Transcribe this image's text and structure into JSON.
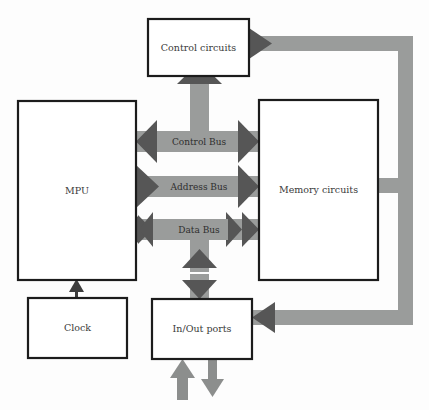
{
  "diagram": {
    "colors": {
      "background": "#fdfdfd",
      "box_fill": "#ffffff",
      "box_border": "#1c1c1c",
      "bus_gray": "#9a9c9b",
      "arrow_dark": "#565656",
      "thin_arrow": "#3d3d3d",
      "text": "#3a3a3a"
    },
    "blocks": [
      {
        "id": "control-circuits",
        "label": "Control circuits",
        "x": 148,
        "y": 19,
        "w": 101,
        "h": 57
      },
      {
        "id": "mpu",
        "label": "MPU",
        "x": 18,
        "y": 101,
        "w": 118,
        "h": 179
      },
      {
        "id": "memory-circuits",
        "label": "Memory circuits",
        "x": 259,
        "y": 100,
        "w": 119,
        "h": 180
      },
      {
        "id": "clock",
        "label": "Clock",
        "x": 28,
        "y": 298,
        "w": 99,
        "h": 60
      },
      {
        "id": "inout-ports",
        "label": "In/Out ports",
        "x": 152,
        "y": 299,
        "w": 100,
        "h": 60
      }
    ],
    "buses": [
      {
        "id": "control-bus",
        "label": "Control Bus",
        "y": 141,
        "direction": "bidirectional-outward"
      },
      {
        "id": "address-bus",
        "label": "Address Bus",
        "y": 186,
        "direction": "mpu-to-memory"
      },
      {
        "id": "data-bus",
        "label": "Data Bus",
        "y": 229,
        "direction": "bidirectional"
      }
    ],
    "connections": [
      {
        "id": "control-bus-to-control-circuits",
        "type": "vertical-gray-arrow-up"
      },
      {
        "id": "data-bus-to-inout-ports",
        "type": "vertical-gray-double-arrow"
      },
      {
        "id": "clock-to-mpu",
        "type": "thin-arrow-up"
      },
      {
        "id": "external-input-to-inout-ports",
        "type": "gray-arrow-up"
      },
      {
        "id": "external-output-from-inout-ports",
        "type": "gray-arrow-down"
      },
      {
        "id": "control-circuits-to-right-rail",
        "type": "gray-rail-right"
      },
      {
        "id": "right-rail-to-memory-circuits",
        "type": "gray-arrow-left"
      },
      {
        "id": "right-rail-to-inout-ports",
        "type": "gray-arrow-left"
      }
    ]
  }
}
